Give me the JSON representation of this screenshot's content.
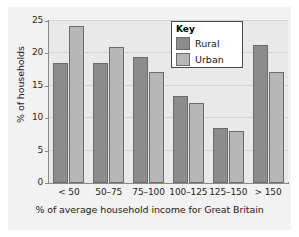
{
  "chart_data": {
    "type": "bar",
    "title": "",
    "xlabel": "% of average household income for Great Britain",
    "ylabel": "% of households",
    "categories": [
      "< 50",
      "50–75",
      "75–100",
      "100–125",
      "125–150",
      "> 150"
    ],
    "series": [
      {
        "name": "Rural",
        "color": "#8c8c8c",
        "values": [
          18.5,
          18.5,
          19.5,
          13.5,
          8.5,
          21.3
        ]
      },
      {
        "name": "Urban",
        "color": "#b7b7b7",
        "values": [
          24.3,
          21.0,
          17.1,
          12.4,
          8.0,
          17.2
        ]
      }
    ],
    "ylim": [
      0,
      25
    ],
    "yticks": [
      0,
      5,
      10,
      15,
      20,
      25
    ],
    "ytick_labels": [
      "0",
      "5",
      "10",
      "15",
      "20",
      "25"
    ],
    "grid": true,
    "legend": {
      "title": "Key",
      "position": "top-right",
      "entries": [
        "Rural",
        "Urban"
      ]
    }
  }
}
